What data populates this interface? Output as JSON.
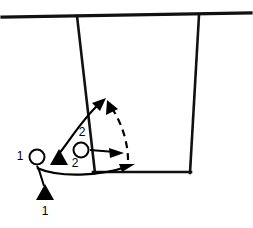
{
  "diagram": {
    "type": "tactical-drill",
    "colors": {
      "line": "#111111",
      "ink": "#000000",
      "background": "#ffffff",
      "ring_fill": "#ffffff"
    },
    "pitch": {
      "touchline": {
        "x1": 2,
        "y1": 17,
        "x2": 251,
        "y2": 13
      },
      "penalty_box_left": {
        "x1": 77,
        "y1": 16,
        "x2": 95,
        "y2": 172
      },
      "penalty_box_bottom": {
        "x1": 94,
        "y1": 172,
        "x2": 190,
        "y2": 172
      },
      "penalty_box_right": {
        "x1": 199,
        "y1": 15,
        "x2": 190,
        "y2": 172
      }
    },
    "players": [
      {
        "id": "cone-1",
        "icon": "cone-marker",
        "shape": "filled-triangle",
        "label": "1",
        "label_position": "below",
        "x": 45,
        "y": 193
      },
      {
        "id": "ring-1",
        "icon": "ball-marker",
        "shape": "open-circle",
        "label": "1",
        "label_position": "left",
        "x": 37,
        "y": 157
      },
      {
        "id": "cone-2",
        "icon": "cone-marker",
        "shape": "filled-triangle",
        "label": "2",
        "label_position": "right-below",
        "x": 59,
        "y": 158
      },
      {
        "id": "ring-2",
        "icon": "ball-marker",
        "shape": "open-circle",
        "label": "2",
        "label_position": "above",
        "x": 81,
        "y": 150
      }
    ],
    "labels": [
      {
        "text": "1",
        "x": 20,
        "y": 157
      },
      {
        "text": "1",
        "x": 45,
        "y": 212
      },
      {
        "text": "2",
        "x": 82,
        "y": 133
      },
      {
        "text": "2",
        "x": 75,
        "y": 164
      }
    ],
    "movements": [
      {
        "id": "run-up-left",
        "style": "solid",
        "description": "curved run from cone 2 up and right",
        "arrow": "up-right"
      },
      {
        "id": "pass-down-right",
        "style": "dashed",
        "description": "dashed pass returning down-right",
        "arrow": "up-right"
      },
      {
        "id": "pass-short-right",
        "style": "solid",
        "description": "short pass from ring 2 to the right",
        "arrow": "right"
      },
      {
        "id": "run-long-right",
        "style": "solid",
        "description": "long curved run from ring 1 to the right along the box edge",
        "arrow": "right"
      },
      {
        "id": "connector-cone1",
        "style": "solid",
        "description": "connector from start point down to cone 1"
      }
    ]
  }
}
